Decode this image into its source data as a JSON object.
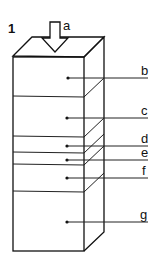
{
  "figure": {
    "number": "1",
    "arrow_label": "a",
    "layers": [
      {
        "label": "b",
        "front_top": 57,
        "front_bottom": 96,
        "leader_y": 78
      },
      {
        "label": "c",
        "front_top": 96,
        "front_bottom": 136,
        "leader_y": 118
      },
      {
        "label": "d",
        "front_top": 136,
        "front_bottom": 153,
        "leader_y": 146
      },
      {
        "label": "e",
        "front_top": 153,
        "front_bottom": 165,
        "leader_y": 160
      },
      {
        "label": "f",
        "front_top": 165,
        "front_bottom": 192,
        "leader_y": 178
      },
      {
        "label": "g",
        "front_top": 192,
        "front_bottom": 251,
        "leader_y": 222
      }
    ]
  },
  "colors": {
    "line": "#111111",
    "background": "#ffffff"
  }
}
